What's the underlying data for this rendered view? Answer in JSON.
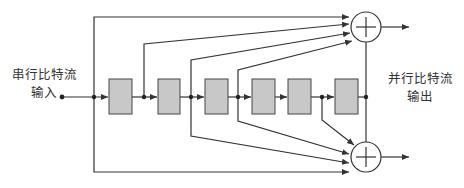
{
  "diagram": {
    "type": "convolutional-encoder-block-diagram",
    "input_label": [
      "串行比特流",
      "输入"
    ],
    "output_label": [
      "并行比特流",
      "输出"
    ],
    "register_count": 6,
    "adders": [
      {
        "id": "top-adder",
        "symbol": "⊕",
        "inputs": 4
      },
      {
        "id": "bottom-adder",
        "symbol": "⊕",
        "inputs": 4
      }
    ],
    "colors": {
      "line": "#333333",
      "register_fill": "#c8c8c8",
      "register_stroke": "#444444"
    }
  }
}
